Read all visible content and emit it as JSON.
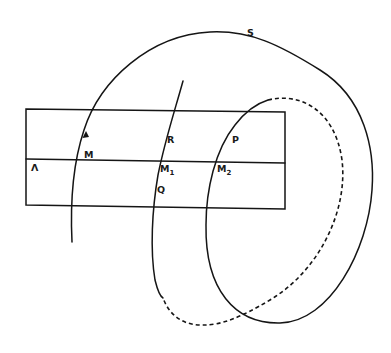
{
  "diagram": {
    "type": "surface-section-sketch",
    "colors": {
      "ink": "#151515",
      "background": "#ffffff"
    },
    "labels": {
      "surface": "S",
      "lambda": "Λ",
      "m": "M",
      "m1_base": "M",
      "m1_sub": "1",
      "m2_base": "M",
      "m2_sub": "2",
      "r": "R",
      "p": "P",
      "q": "Q"
    },
    "elements": {
      "strip": "rectangle cross-section with horizontal line Λ",
      "curve_solid": "orbit curve S with arrow near M",
      "curve_dashed": "hidden portion of curve (dashed)"
    }
  }
}
